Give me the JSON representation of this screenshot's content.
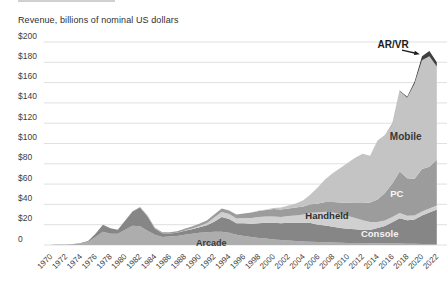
{
  "chart_data": {
    "type": "area",
    "stacked": true,
    "title": "Revenue, billions of nominal US dollars",
    "xlabel": "",
    "ylabel": "Revenue, billions of nominal US dollars",
    "ylim": [
      0,
      200
    ],
    "y_tick_step": 20,
    "y_tick_labels": [
      "0",
      "$20",
      "$40",
      "$60",
      "$80",
      "$100",
      "$120",
      "$140",
      "$160",
      "$180",
      "$200"
    ],
    "x_tick_labels": [
      "1970",
      "1972",
      "1974",
      "1976",
      "1978",
      "1980",
      "1982",
      "1984",
      "1986",
      "1988",
      "1990",
      "1992",
      "1994",
      "1996",
      "1998",
      "2000",
      "2002",
      "2004",
      "2006",
      "2008",
      "2010",
      "2012",
      "2014",
      "2016",
      "2018",
      "2020",
      "2022"
    ],
    "grid": "horizontal",
    "legend": "in-chart direct labels",
    "x": [
      1970,
      1971,
      1972,
      1973,
      1974,
      1975,
      1976,
      1977,
      1978,
      1979,
      1980,
      1981,
      1982,
      1983,
      1984,
      1985,
      1986,
      1987,
      1988,
      1989,
      1990,
      1991,
      1992,
      1993,
      1994,
      1995,
      1996,
      1997,
      1998,
      1999,
      2000,
      2001,
      2002,
      2003,
      2004,
      2005,
      2006,
      2007,
      2008,
      2009,
      2010,
      2011,
      2012,
      2013,
      2014,
      2015,
      2016,
      2017,
      2018,
      2019,
      2020,
      2021,
      2022
    ],
    "series": [
      {
        "name": "Arcade",
        "color": "#adadad",
        "values": [
          0.2,
          0.3,
          0.4,
          0.8,
          1.5,
          3,
          8,
          13,
          11,
          11,
          15,
          19,
          18.5,
          14,
          10,
          8,
          8.5,
          9,
          10,
          11,
          12,
          12.5,
          13,
          13,
          12,
          10,
          9,
          8,
          7,
          6.5,
          5.5,
          5,
          4.5,
          4,
          3.5,
          3.2,
          3,
          2.8,
          2.5,
          2.3,
          2.1,
          2,
          1.9,
          1.8,
          1.7,
          1.6,
          1.5,
          1.4,
          1.3,
          1.2,
          1,
          1,
          1
        ]
      },
      {
        "name": "Console",
        "color": "#868686",
        "values": [
          0,
          0.1,
          0.2,
          0.3,
          0.5,
          1,
          3,
          7,
          5.5,
          4,
          9,
          14,
          18.5,
          14,
          6,
          3.5,
          2.8,
          3,
          4,
          4.5,
          5.5,
          7,
          10,
          14.5,
          13.5,
          11.5,
          12.5,
          13,
          14.5,
          15.5,
          16.5,
          16.5,
          17.5,
          18,
          18.5,
          18.5,
          17,
          16.5,
          15.5,
          14.5,
          14,
          13.5,
          13,
          13,
          15,
          17,
          21,
          25,
          23,
          24,
          28,
          31,
          34
        ]
      },
      {
        "name": "Handheld",
        "color": "#d0d0d0",
        "values": [
          0,
          0,
          0,
          0,
          0,
          0,
          0,
          0,
          0,
          0,
          0,
          0,
          0,
          0,
          0,
          0,
          0,
          0,
          0.2,
          0.7,
          1.2,
          2,
          4,
          5,
          5,
          4.5,
          5,
          5.5,
          6,
          6,
          6,
          6,
          6.5,
          7,
          8,
          10,
          12,
          13.5,
          14,
          13.5,
          12.5,
          11,
          9.5,
          8,
          6,
          5.5,
          5,
          5,
          4.5,
          4,
          4,
          4,
          4
        ]
      },
      {
        "name": "PC",
        "color": "#9c9c9c",
        "values": [
          0,
          0,
          0,
          0,
          0,
          0,
          0,
          0,
          0,
          0,
          0,
          0.2,
          0.5,
          1,
          1,
          1,
          1.2,
          1.5,
          1.8,
          2,
          2.3,
          2.5,
          3,
          3.5,
          3.5,
          4,
          4.5,
          5.5,
          6,
          6.5,
          7.5,
          7.5,
          7.5,
          8,
          8,
          8.5,
          9,
          9.5,
          10.5,
          11.5,
          13,
          15,
          17,
          19,
          22,
          27,
          33,
          41,
          37,
          36,
          42,
          41,
          45
        ]
      },
      {
        "name": "Mobile",
        "color": "#c4c4c4",
        "values": [
          0,
          0,
          0,
          0,
          0,
          0,
          0,
          0,
          0,
          0,
          0,
          0,
          0,
          0,
          0,
          0,
          0,
          0,
          0,
          0,
          0,
          0,
          0,
          0,
          0,
          0,
          0,
          0,
          0.5,
          0.5,
          1,
          2,
          3,
          4,
          6,
          9.8,
          16,
          22.7,
          28.5,
          34.2,
          39.4,
          44.5,
          48.6,
          46.2,
          58.3,
          57.4,
          58.5,
          79.2,
          79.2,
          93.8,
          107,
          109,
          92
        ]
      },
      {
        "name": "AR/VR",
        "color": "#3f3f3f",
        "values": [
          0,
          0,
          0,
          0,
          0,
          0,
          0,
          0,
          0,
          0,
          0,
          0,
          0,
          0,
          0,
          0,
          0,
          0,
          0,
          0,
          0,
          0,
          0,
          0,
          0,
          0,
          0,
          0,
          0,
          0,
          0,
          0,
          0,
          0,
          0,
          0,
          0,
          0,
          0,
          0,
          0,
          0,
          0,
          0,
          0,
          0,
          0.5,
          0.5,
          1,
          2,
          4,
          5,
          4
        ]
      }
    ],
    "annotations": [
      {
        "label": "Arcade",
        "year": 1991.6,
        "value": 1.8,
        "color": "#3b3b3b",
        "size": 9
      },
      {
        "label": "Handheld",
        "year": 2007.2,
        "value": 28.5,
        "color": "#2e2e2e",
        "size": 9.5
      },
      {
        "label": "Console",
        "year": 2014.3,
        "value": 11,
        "color": "#f4f4f4",
        "size": 9.5
      },
      {
        "label": "PC",
        "year": 2016.6,
        "value": 51,
        "color": "#f6f6f6",
        "size": 9.5
      },
      {
        "label": "Mobile",
        "year": 2017.8,
        "value": 107,
        "color": "#383838",
        "size": 10
      },
      {
        "label": "AR/VR",
        "year": 2016.1,
        "value": 198,
        "color": "#1c1c1c",
        "size": 10
      }
    ],
    "arrow": {
      "from": {
        "year": 2017.3,
        "value": 192
      },
      "to": {
        "year": 2019.7,
        "value": 188
      }
    },
    "colors": {
      "background": "#ffffff",
      "grid": "#dcdcdc",
      "y_tick_text": "#3d3d3d",
      "x_tick_text": "#454545",
      "title_text": "#2f2f2f",
      "arrow": "#1c1c1c"
    }
  }
}
